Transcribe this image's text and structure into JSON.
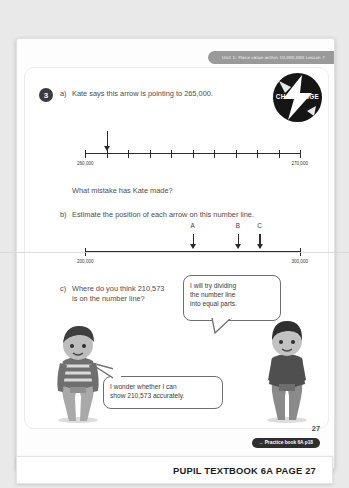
{
  "page": {
    "running_head": "Unit 1: Place value within 10,000,000 Lesson 7",
    "badge_label": "CHALLENGE",
    "question_number": "3",
    "page_number": "27"
  },
  "question": {
    "a_label": "a)",
    "a_text": "Kate says this arrow is pointing to 265,000.",
    "a_followup": "What mistake has Kate made?",
    "b_label": "b)",
    "b_text": "Estimate the position of each arrow on this number line.",
    "c_label": "c)",
    "c_line1": "Where do you think 210,573",
    "c_line2": "is on the number line?"
  },
  "numberline_a": {
    "start_label": "260,000",
    "end_label": "270,000",
    "intervals": 10,
    "arrow_at_tick": 1,
    "arrow_name": "kate-arrow"
  },
  "numberline_b": {
    "start_label": "200,000",
    "end_label": "300,000",
    "arrows": [
      {
        "label": "A",
        "position_pct": 50
      },
      {
        "label": "B",
        "position_pct": 71
      },
      {
        "label": "C",
        "position_pct": 81
      }
    ]
  },
  "speech": {
    "girl_line1": "I will try dividing",
    "girl_line2": "the number line",
    "girl_line3": "into equal parts.",
    "boy_line1": "I wonder whether I can",
    "boy_line2": "show 210,573 accurately."
  },
  "footer": {
    "practice_link": "→ Practice book 6A p18",
    "book_title": "PUPIL TEXTBOOK 6A",
    "page_label": "PAGE 27"
  },
  "colors": {
    "badge_bg": "#151515",
    "runhead_bg": "#9a9a9a",
    "ink": "#3b3b3b",
    "pill_bg": "#2f2f2f"
  }
}
